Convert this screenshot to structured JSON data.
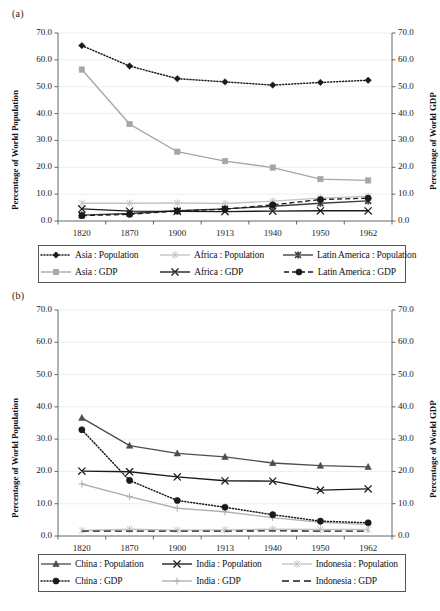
{
  "figure": {
    "panel_a_label": "(a)",
    "panel_b_label": "(b)",
    "y_left_title": "Percentage of World Population",
    "y_right_title": "Percentage of World GDP",
    "y_ticks": [
      "0.0",
      "10.0",
      "20.0",
      "30.0",
      "40.0",
      "50.0",
      "60.0",
      "70.0"
    ],
    "x_ticks": [
      "1820",
      "1870",
      "1900",
      "1913",
      "1940",
      "1950",
      "1962"
    ]
  },
  "colors": {
    "black": "#1a1a1a",
    "dark_gray": "#3d3d3d",
    "mid_gray": "#8c8c8c",
    "light_gray": "#c2c2c2",
    "grid": "#e8e8e8",
    "axis": "#666666",
    "legend_border": "#555555"
  },
  "chart_data": [
    {
      "type": "line",
      "title": "(a)",
      "xlabel": "",
      "ylabel": "Percentage of World Population",
      "y2label": "Percentage of World GDP",
      "x": [
        "1820",
        "1870",
        "1900",
        "1913",
        "1940",
        "1950",
        "1962"
      ],
      "ylim": [
        0,
        70
      ],
      "y2lim": [
        0,
        70
      ],
      "grid": true,
      "legend_position": "bottom",
      "series": [
        {
          "name": "Asia : Population",
          "axis": "left",
          "marker": "diamond",
          "dash": "dotted",
          "color": "#1a1a1a",
          "values": [
            65.3,
            57.7,
            53.0,
            51.8,
            50.6,
            51.6,
            52.4
          ]
        },
        {
          "name": "Africa : Population",
          "axis": "left",
          "marker": "asterisk",
          "dash": "solid",
          "color": "#c2c2c2",
          "values": [
            6.6,
            6.6,
            6.7,
            6.5,
            7.4,
            8.5,
            9.2
          ]
        },
        {
          "name": "Latin America : Population",
          "axis": "left",
          "marker": "asterisk-bold",
          "dash": "solid",
          "color": "#3d3d3d",
          "values": [
            2.2,
            2.8,
            3.8,
            4.5,
            5.5,
            6.6,
            7.5
          ]
        },
        {
          "name": "Asia : GDP",
          "axis": "right",
          "marker": "square",
          "dash": "solid",
          "color": "#a6a6a6",
          "values": [
            56.4,
            36.1,
            25.8,
            22.3,
            19.9,
            15.6,
            15.1
          ]
        },
        {
          "name": "Africa : GDP",
          "axis": "right",
          "marker": "x",
          "dash": "solid",
          "color": "#1a1a1a",
          "values": [
            4.5,
            3.7,
            3.6,
            3.5,
            3.7,
            3.8,
            3.8
          ]
        },
        {
          "name": "Latin America : GDP",
          "axis": "right",
          "marker": "circle",
          "dash": "dashed",
          "color": "#1a1a1a",
          "values": [
            2.0,
            2.5,
            3.7,
            4.4,
            6.0,
            8.0,
            8.5
          ]
        }
      ]
    },
    {
      "type": "line",
      "title": "(b)",
      "xlabel": "",
      "ylabel": "Percentage of World Population",
      "y2label": "Percentage of World GDP",
      "x": [
        "1820",
        "1870",
        "1900",
        "1913",
        "1940",
        "1950",
        "1962"
      ],
      "ylim": [
        0,
        70
      ],
      "y2lim": [
        0,
        70
      ],
      "grid": true,
      "legend_position": "bottom",
      "series": [
        {
          "name": "China : Population",
          "axis": "left",
          "marker": "triangle",
          "dash": "solid",
          "color": "#4d4d4d",
          "values": [
            36.6,
            28.0,
            25.6,
            24.5,
            22.6,
            21.8,
            21.4
          ]
        },
        {
          "name": "India : Population",
          "axis": "left",
          "marker": "x",
          "dash": "solid",
          "color": "#1a1a1a",
          "values": [
            20.1,
            19.9,
            18.3,
            17.1,
            17.0,
            14.2,
            14.6
          ]
        },
        {
          "name": "Indonesia : Population",
          "axis": "left",
          "marker": "asterisk",
          "dash": "solid",
          "color": "#c2c2c2",
          "values": [
            1.7,
            2.1,
            1.8,
            1.9,
            2.1,
            2.0,
            2.0
          ]
        },
        {
          "name": "China : GDP",
          "axis": "right",
          "marker": "circle",
          "dash": "dotted",
          "color": "#1a1a1a",
          "values": [
            32.9,
            17.2,
            11.0,
            8.9,
            6.6,
            4.6,
            4.1
          ]
        },
        {
          "name": "India : GDP",
          "axis": "right",
          "marker": "plus",
          "dash": "solid",
          "color": "#b0b0b0",
          "values": [
            16.1,
            12.2,
            8.6,
            7.5,
            5.7,
            4.2,
            3.6
          ]
        },
        {
          "name": "Indonesia : GDP",
          "axis": "right",
          "marker": "none",
          "dash": "long-dash",
          "color": "#1a1a1a",
          "values": [
            1.5,
            1.5,
            1.5,
            1.5,
            1.6,
            1.5,
            1.5
          ]
        }
      ]
    }
  ],
  "legend_a": {
    "rows": [
      [
        {
          "label": "Asia : Population",
          "key": "dotted-diamond-black"
        },
        {
          "label": "Africa : Population",
          "key": "solid-asterisk-lightgray"
        },
        {
          "label": "Latin America : Population",
          "key": "solid-asterisk-darkgray"
        }
      ],
      [
        {
          "label": "Asia : GDP",
          "key": "solid-square-gray"
        },
        {
          "label": "Africa : GDP",
          "key": "solid-x-black"
        },
        {
          "label": "Latin America : GDP",
          "key": "dashed-circle-black"
        }
      ]
    ]
  },
  "legend_b": {
    "rows": [
      [
        {
          "label": "China : Population",
          "key": "solid-triangle-darkgray"
        },
        {
          "label": "India : Population",
          "key": "solid-x-black"
        },
        {
          "label": "Indonesia : Population",
          "key": "solid-asterisk-lightgray"
        }
      ],
      [
        {
          "label": "China : GDP",
          "key": "dotted-circle-black"
        },
        {
          "label": "India : GDP",
          "key": "solid-plus-gray"
        },
        {
          "label": "Indonesia : GDP",
          "key": "longdash-none-black"
        }
      ]
    ]
  }
}
